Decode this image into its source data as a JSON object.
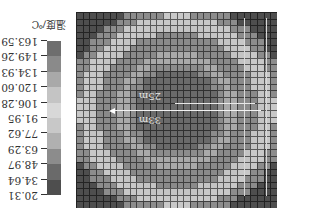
{
  "chart_data": {
    "type": "heatmap",
    "orientation": "rotated 180 degrees",
    "title": "",
    "legend": {
      "title": "温度/℃",
      "ticks": [
        "163.59",
        "149.26",
        "134.93",
        "120.60",
        "106.28",
        "91.95",
        "77.62",
        "63.29",
        "48.97",
        "34.64",
        "20.31"
      ],
      "colors": [
        "#555555",
        "#6e6e6e",
        "#8a8a8a",
        "#a9a9a9",
        "#c4c4c4",
        "#d8d8d8",
        "#c8c8c8",
        "#b0b0b0",
        "#8c8c8c",
        "#6a6a6a",
        "#4e4e4e"
      ]
    },
    "grid": {
      "rows": 30,
      "cols": 30
    },
    "annotations": [
      {
        "text": "33m",
        "type": "arrow-radius"
      },
      {
        "text": "25m",
        "type": "radius"
      }
    ],
    "bands_by_radius": [
      {
        "r_max": 6.5,
        "value": 34.64
      },
      {
        "r_max": 7.5,
        "value": 48.97
      },
      {
        "r_max": 9,
        "value": 120.6
      },
      {
        "r_max": 12,
        "value": 134.93
      },
      {
        "r_max": 13.2,
        "value": 106.28
      },
      {
        "r_max": 14.6,
        "value": 77.62
      },
      {
        "r_max": 16.5,
        "value": 48.97
      },
      {
        "r_max": 99,
        "value": 20.31
      }
    ]
  },
  "labels": {
    "r33": "33m",
    "r25": "25m"
  }
}
